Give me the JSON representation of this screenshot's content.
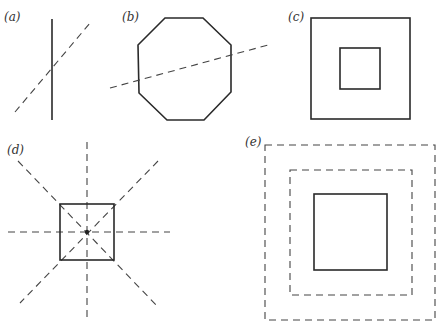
{
  "figure": {
    "panels": [
      {
        "id": "a",
        "label": "(a)",
        "description": "solid vertical line crossed by dashed diagonal line"
      },
      {
        "id": "b",
        "label": "(b)",
        "description": "regular octagon bisected by dashed slanted line"
      },
      {
        "id": "c",
        "label": "(c)",
        "description": "small solid square centered inside larger solid square"
      },
      {
        "id": "d",
        "label": "(d)",
        "description": "solid square with four dashed symmetry axes through center point"
      },
      {
        "id": "e",
        "label": "(e)",
        "description": "solid square inside two concentric dashed squares"
      }
    ]
  },
  "colors": {
    "line": "#2a2a2a",
    "dashed": "#444444",
    "background": "#ffffff"
  }
}
